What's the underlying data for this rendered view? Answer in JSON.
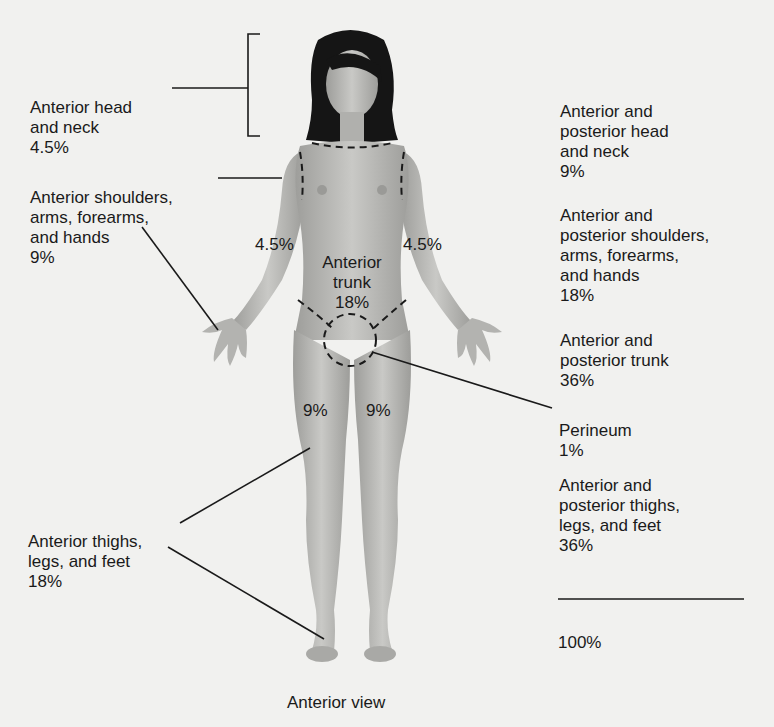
{
  "diagram": {
    "caption": "Anterior view",
    "colors": {
      "background": "#f1f1ef",
      "skin": "#b9b9b6",
      "skin_shade": "#9a9a97",
      "hair": "#151515",
      "ink": "#1a1a1a"
    },
    "left_labels": [
      {
        "name": "Anterior head\nand neck",
        "value": "4.5%"
      },
      {
        "name": "Anterior shoulders,\narms, forearms,\nand hands",
        "value": "9%"
      },
      {
        "name": "Anterior thighs,\nlegs, and feet",
        "value": "18%"
      }
    ],
    "figure_labels": {
      "left_arm": "4.5%",
      "right_arm": "4.5%",
      "trunk_name": "Anterior\ntrunk",
      "trunk_value": "18%",
      "left_thigh": "9%",
      "right_thigh": "9%"
    },
    "right_labels": [
      {
        "name": "Anterior and\nposterior head\nand neck",
        "value": "9%"
      },
      {
        "name": "Anterior and\nposterior shoulders,\narms, forearms,\nand hands",
        "value": "18%"
      },
      {
        "name": "Anterior and\nposterior trunk",
        "value": "36%"
      },
      {
        "name": "Perineum",
        "value": "1%"
      },
      {
        "name": "Anterior and\nposterior thighs,\nlegs, and feet",
        "value": "36%"
      }
    ],
    "total": "100%"
  }
}
